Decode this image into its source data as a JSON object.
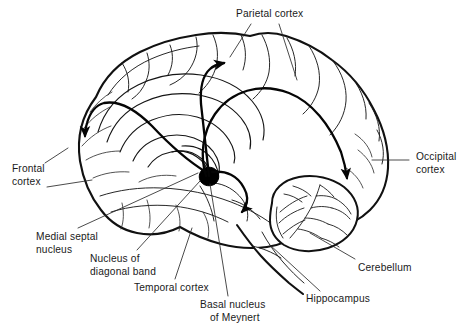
{
  "figure": {
    "background_color": "#ffffff",
    "ink_color": "#111111",
    "text_color": "#1a1a1a",
    "width": 472,
    "height": 334
  },
  "labels": {
    "parietal_cortex": {
      "line1": "Parietal cortex",
      "line2": ""
    },
    "occipital_cortex": {
      "line1": "Occipital",
      "line2": "cortex"
    },
    "frontal_cortex": {
      "line1": "Frontal",
      "line2": "cortex"
    },
    "medial_septal_nucleus": {
      "line1": "Medial septal",
      "line2": "nucleus"
    },
    "nucleus_of_diagonal_band": {
      "line1": "Nucleus of",
      "line2": "diagonal band"
    },
    "temporal_cortex": {
      "line1": "Temporal cortex",
      "line2": ""
    },
    "basal_nucleus_of_meynert": {
      "line1": "Basal nucleus",
      "line2": "of Meynert"
    },
    "hippocampus": {
      "line1": "Hippocampus",
      "line2": ""
    },
    "cerebellum": {
      "line1": "Cerebellum",
      "line2": ""
    }
  },
  "structures": {
    "cerebrum": "cerebral-hemisphere-sagittal",
    "cerebellum": "cerebellum-arbor-vitae",
    "brainstem": "brainstem",
    "basal_nucleus_marker": "filled-black-blob"
  },
  "arrows": [
    {
      "name": "arrow-to-frontal-cortex",
      "target": "Frontal cortex",
      "direction": "down-left"
    },
    {
      "name": "arrow-to-parietal-cortex",
      "target": "Parietal cortex",
      "direction": "up-right"
    },
    {
      "name": "arrow-to-occipital-cortex",
      "target": "Occipital cortex",
      "direction": "down-right"
    },
    {
      "name": "arrow-to-temporal-cortex",
      "target": "Temporal cortex",
      "direction": "down"
    }
  ]
}
